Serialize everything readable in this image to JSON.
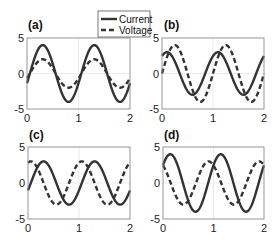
{
  "figure": {
    "width": 279,
    "height": 248,
    "colors": {
      "line": "#333333",
      "axis": "#8a8a8a",
      "grid": "#e6e6e6",
      "text": "#222222"
    }
  },
  "legend": {
    "entries": [
      {
        "label": "Current",
        "style": "solid"
      },
      {
        "label": "Voltage",
        "style": "dashed"
      }
    ]
  },
  "chart_data": [
    {
      "type": "line",
      "panel_label": "(a)",
      "xlabel": "",
      "ylabel": "",
      "xlim": [
        0,
        2
      ],
      "ylim": [
        -5,
        5
      ],
      "xticks": [
        0,
        1,
        2
      ],
      "yticks": [
        -5,
        0,
        5
      ],
      "grid": true,
      "series": [
        {
          "name": "Current",
          "style": "solid",
          "amplitude": 4,
          "frequency": 1,
          "phase_deg": -20
        },
        {
          "name": "Voltage",
          "style": "dashed",
          "amplitude": 2,
          "frequency": 1,
          "phase_deg": -20
        }
      ],
      "note": "Current and voltage in phase"
    },
    {
      "type": "line",
      "panel_label": "(b)",
      "xlabel": "",
      "ylabel": "",
      "xlim": [
        0,
        2
      ],
      "ylim": [
        -5,
        5
      ],
      "xticks": [
        0,
        1,
        2
      ],
      "yticks": [
        -5,
        0,
        5
      ],
      "grid": true,
      "series": [
        {
          "name": "Current",
          "style": "solid",
          "amplitude": 3,
          "frequency": 1,
          "phase_deg": 55
        },
        {
          "name": "Voltage",
          "style": "dashed",
          "amplitude": 4,
          "frequency": 1,
          "phase_deg": 0
        }
      ],
      "note": "Current leads voltage"
    },
    {
      "type": "line",
      "panel_label": "(c)",
      "xlabel": "",
      "ylabel": "",
      "xlim": [
        0,
        2
      ],
      "ylim": [
        -5,
        5
      ],
      "xticks": [
        0,
        1,
        2
      ],
      "yticks": [
        -5,
        0,
        5
      ],
      "grid": true,
      "series": [
        {
          "name": "Current",
          "style": "solid",
          "amplitude": 3,
          "frequency": 1,
          "phase_deg": -20
        },
        {
          "name": "Voltage",
          "style": "dashed",
          "amplitude": 3,
          "frequency": 1,
          "phase_deg": 70
        }
      ],
      "note": "Voltage leads current by about 90 degrees"
    },
    {
      "type": "line",
      "panel_label": "(d)",
      "xlabel": "",
      "ylabel": "",
      "xlim": [
        0,
        2
      ],
      "ylim": [
        -5,
        5
      ],
      "xticks": [
        0,
        1,
        2
      ],
      "yticks": [
        -5,
        0,
        5
      ],
      "grid": true,
      "series": [
        {
          "name": "Current",
          "style": "solid",
          "amplitude": 4,
          "frequency": 1,
          "phase_deg": 38
        },
        {
          "name": "Voltage",
          "style": "dashed",
          "amplitude": 3,
          "frequency": 1,
          "phase_deg": 125
        }
      ],
      "note": "Voltage leads current"
    }
  ],
  "panels_layout": [
    {
      "x0": 27,
      "y0": 38,
      "x1": 130,
      "y1": 109,
      "label_x": 28,
      "label_y": 29
    },
    {
      "x0": 162,
      "y0": 38,
      "x1": 264,
      "y1": 109,
      "label_x": 164,
      "label_y": 29
    },
    {
      "x0": 28,
      "y0": 147,
      "x1": 130,
      "y1": 219,
      "label_x": 29,
      "label_y": 139
    },
    {
      "x0": 163,
      "y0": 147,
      "x1": 264,
      "y1": 219,
      "label_x": 164,
      "label_y": 139
    }
  ]
}
